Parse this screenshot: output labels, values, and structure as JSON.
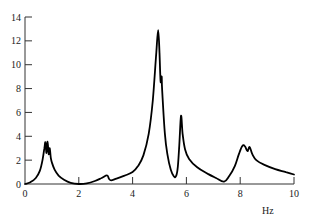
{
  "chart_data": {
    "type": "line",
    "title": "",
    "xlabel": "Hz",
    "ylabel": "",
    "xlim": [
      0,
      10
    ],
    "ylim": [
      0,
      14
    ],
    "grid": false,
    "legend": null,
    "x_ticks": [
      0,
      2,
      4,
      6,
      8,
      10
    ],
    "y_ticks": [
      0,
      2,
      4,
      6,
      8,
      10,
      12,
      14
    ],
    "x_tick_labels": [
      "0",
      "2",
      "4",
      "6",
      "8",
      "10"
    ],
    "y_tick_labels": [
      "0",
      "2",
      "4",
      "6",
      "8",
      "10",
      "12",
      "14"
    ],
    "series": [
      {
        "name": "spectrum",
        "color": "#000000",
        "points": [
          [
            0.0,
            0.0
          ],
          [
            0.2,
            0.15
          ],
          [
            0.4,
            0.5
          ],
          [
            0.55,
            1.1
          ],
          [
            0.65,
            2.0
          ],
          [
            0.72,
            3.0
          ],
          [
            0.76,
            3.5
          ],
          [
            0.8,
            2.6
          ],
          [
            0.84,
            3.55
          ],
          [
            0.88,
            2.5
          ],
          [
            0.92,
            3.0
          ],
          [
            0.96,
            2.2
          ],
          [
            1.0,
            1.8
          ],
          [
            1.1,
            1.2
          ],
          [
            1.25,
            0.7
          ],
          [
            1.45,
            0.35
          ],
          [
            1.7,
            0.1
          ],
          [
            2.0,
            0.0
          ],
          [
            2.3,
            0.05
          ],
          [
            2.6,
            0.25
          ],
          [
            2.85,
            0.5
          ],
          [
            3.05,
            0.72
          ],
          [
            3.12,
            0.45
          ],
          [
            3.2,
            0.3
          ],
          [
            3.4,
            0.45
          ],
          [
            3.7,
            0.7
          ],
          [
            4.0,
            1.0
          ],
          [
            4.2,
            1.5
          ],
          [
            4.4,
            2.4
          ],
          [
            4.6,
            4.2
          ],
          [
            4.75,
            7.0
          ],
          [
            4.88,
            11.0
          ],
          [
            4.95,
            12.9
          ],
          [
            5.0,
            11.0
          ],
          [
            5.04,
            8.6
          ],
          [
            5.08,
            9.0
          ],
          [
            5.1,
            7.8
          ],
          [
            5.2,
            4.2
          ],
          [
            5.3,
            2.4
          ],
          [
            5.42,
            1.2
          ],
          [
            5.52,
            0.7
          ],
          [
            5.6,
            0.6
          ],
          [
            5.67,
            1.2
          ],
          [
            5.73,
            3.0
          ],
          [
            5.8,
            5.7
          ],
          [
            5.86,
            4.2
          ],
          [
            5.95,
            2.9
          ],
          [
            6.1,
            2.1
          ],
          [
            6.4,
            1.4
          ],
          [
            6.8,
            0.85
          ],
          [
            7.1,
            0.5
          ],
          [
            7.4,
            0.2
          ],
          [
            7.6,
            0.7
          ],
          [
            7.8,
            1.5
          ],
          [
            7.95,
            2.5
          ],
          [
            8.08,
            3.2
          ],
          [
            8.18,
            3.15
          ],
          [
            8.27,
            2.75
          ],
          [
            8.35,
            3.1
          ],
          [
            8.45,
            2.5
          ],
          [
            8.6,
            2.0
          ],
          [
            8.9,
            1.6
          ],
          [
            9.3,
            1.25
          ],
          [
            9.7,
            1.0
          ],
          [
            10.0,
            0.8
          ]
        ]
      }
    ],
    "annotations": [
      {
        "x": 0.8,
        "y": 3.5,
        "text": "triple peak"
      },
      {
        "x": 4.95,
        "y": 12.9,
        "text": "main peak"
      },
      {
        "x": 5.8,
        "y": 5.7,
        "text": "secondary peak"
      },
      {
        "x": 8.1,
        "y": 3.2,
        "text": "double peak"
      }
    ]
  },
  "layout": {
    "plot": {
      "left": 25,
      "right": 294,
      "top": 17,
      "bottom": 184
    },
    "line_color": "#000000",
    "axis_color": "#333333"
  }
}
